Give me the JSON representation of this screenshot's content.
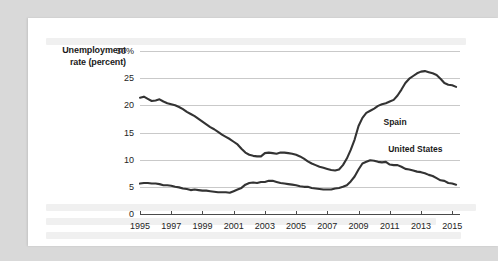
{
  "figure": {
    "axis_title_line1": "Unemployment",
    "axis_title_line2": "rate (percent)",
    "line_color": "#333333",
    "grid_color": "#c9c9c9",
    "axis_color": "#4a4a4a",
    "card_color": "#ffffff",
    "page_background": "#d9d9d9"
  },
  "chart_data": {
    "type": "line",
    "title": "",
    "subtitle": "",
    "xlabel": "",
    "ylabel": "Unemployment rate (percent)",
    "xlim": [
      1995,
      2015.5
    ],
    "ylim": [
      0,
      30
    ],
    "grid": true,
    "grid_axis": "y",
    "legend": "inline-annotations",
    "ytick_labels": [
      "0",
      "5",
      "10",
      "15",
      "20",
      "25",
      "30%"
    ],
    "ytick_values": [
      0,
      5,
      10,
      15,
      20,
      25,
      30
    ],
    "xtick_labels": [
      "1995",
      "1997",
      "1999",
      "2001",
      "2003",
      "2005",
      "2007",
      "2009",
      "2011",
      "2013",
      "2015"
    ],
    "xtick_values": [
      1995,
      1997,
      1999,
      2001,
      2003,
      2005,
      2007,
      2009,
      2011,
      2013,
      2015
    ],
    "annotations": [
      {
        "text": "Spain",
        "x": 2010.6,
        "y": 17.0
      },
      {
        "text": "United States",
        "x": 2010.9,
        "y": 11.9
      }
    ],
    "series": [
      {
        "name": "Spain",
        "color": "#333333",
        "x": [
          1995.0,
          1995.25,
          1995.5,
          1995.75,
          1996.0,
          1996.25,
          1996.5,
          1996.75,
          1997.0,
          1997.25,
          1997.5,
          1997.75,
          1998.0,
          1998.25,
          1998.5,
          1998.75,
          1999.0,
          1999.25,
          1999.5,
          1999.75,
          2000.0,
          2000.25,
          2000.5,
          2000.75,
          2001.0,
          2001.25,
          2001.5,
          2001.75,
          2002.0,
          2002.25,
          2002.5,
          2002.75,
          2003.0,
          2003.25,
          2003.5,
          2003.75,
          2004.0,
          2004.25,
          2004.5,
          2004.75,
          2005.0,
          2005.25,
          2005.5,
          2005.75,
          2006.0,
          2006.25,
          2006.5,
          2006.75,
          2007.0,
          2007.25,
          2007.5,
          2007.75,
          2008.0,
          2008.25,
          2008.5,
          2008.75,
          2009.0,
          2009.25,
          2009.5,
          2009.75,
          2010.0,
          2010.25,
          2010.5,
          2010.75,
          2011.0,
          2011.25,
          2011.5,
          2011.75,
          2012.0,
          2012.25,
          2012.5,
          2012.75,
          2013.0,
          2013.25,
          2013.5,
          2013.75,
          2014.0,
          2014.25,
          2014.5,
          2014.75,
          2015.0,
          2015.25
        ],
        "values": [
          21.4,
          21.6,
          21.2,
          20.8,
          20.9,
          21.1,
          20.7,
          20.4,
          20.2,
          20.0,
          19.7,
          19.3,
          18.8,
          18.4,
          18.0,
          17.5,
          17.0,
          16.5,
          16.0,
          15.6,
          15.1,
          14.6,
          14.2,
          13.8,
          13.3,
          12.8,
          12.0,
          11.3,
          10.9,
          10.7,
          10.6,
          10.6,
          11.2,
          11.3,
          11.2,
          11.1,
          11.3,
          11.3,
          11.2,
          11.1,
          10.9,
          10.6,
          10.2,
          9.7,
          9.3,
          9.0,
          8.7,
          8.5,
          8.3,
          8.1,
          8.0,
          8.2,
          9.0,
          10.2,
          11.8,
          13.7,
          16.2,
          17.7,
          18.6,
          19.0,
          19.4,
          19.9,
          20.2,
          20.4,
          20.7,
          21.0,
          21.8,
          22.9,
          24.1,
          24.9,
          25.4,
          25.9,
          26.2,
          26.3,
          26.1,
          25.9,
          25.6,
          24.9,
          24.1,
          23.8,
          23.7,
          23.4
        ]
      },
      {
        "name": "United States",
        "color": "#333333",
        "x": [
          1995.0,
          1995.25,
          1995.5,
          1995.75,
          1996.0,
          1996.25,
          1996.5,
          1996.75,
          1997.0,
          1997.25,
          1997.5,
          1997.75,
          1998.0,
          1998.25,
          1998.5,
          1998.75,
          1999.0,
          1999.25,
          1999.5,
          1999.75,
          2000.0,
          2000.25,
          2000.5,
          2000.75,
          2001.0,
          2001.25,
          2001.5,
          2001.75,
          2002.0,
          2002.25,
          2002.5,
          2002.75,
          2003.0,
          2003.25,
          2003.5,
          2003.75,
          2004.0,
          2004.25,
          2004.5,
          2004.75,
          2005.0,
          2005.25,
          2005.5,
          2005.75,
          2006.0,
          2006.25,
          2006.5,
          2006.75,
          2007.0,
          2007.25,
          2007.5,
          2007.75,
          2008.0,
          2008.25,
          2008.5,
          2008.75,
          2009.0,
          2009.25,
          2009.5,
          2009.75,
          2010.0,
          2010.25,
          2010.5,
          2010.75,
          2011.0,
          2011.25,
          2011.5,
          2011.75,
          2012.0,
          2012.25,
          2012.5,
          2012.75,
          2013.0,
          2013.25,
          2013.5,
          2013.75,
          2014.0,
          2014.25,
          2014.5,
          2014.75,
          2015.0,
          2015.25
        ],
        "values": [
          5.6,
          5.7,
          5.7,
          5.6,
          5.6,
          5.5,
          5.3,
          5.3,
          5.2,
          5.0,
          4.9,
          4.7,
          4.6,
          4.4,
          4.5,
          4.4,
          4.3,
          4.3,
          4.2,
          4.1,
          4.0,
          4.0,
          4.0,
          3.9,
          4.2,
          4.5,
          4.8,
          5.4,
          5.7,
          5.8,
          5.7,
          5.9,
          5.9,
          6.1,
          6.1,
          5.9,
          5.7,
          5.6,
          5.5,
          5.4,
          5.3,
          5.1,
          5.0,
          5.0,
          4.8,
          4.7,
          4.6,
          4.5,
          4.5,
          4.5,
          4.7,
          4.8,
          5.0,
          5.3,
          6.0,
          6.9,
          8.2,
          9.3,
          9.6,
          9.9,
          9.8,
          9.6,
          9.5,
          9.6,
          9.1,
          9.0,
          9.0,
          8.7,
          8.3,
          8.2,
          8.0,
          7.8,
          7.7,
          7.5,
          7.2,
          7.0,
          6.6,
          6.2,
          6.1,
          5.7,
          5.6,
          5.4
        ]
      }
    ]
  },
  "background_text_hint": "faint-show-through-paragraph-lines"
}
